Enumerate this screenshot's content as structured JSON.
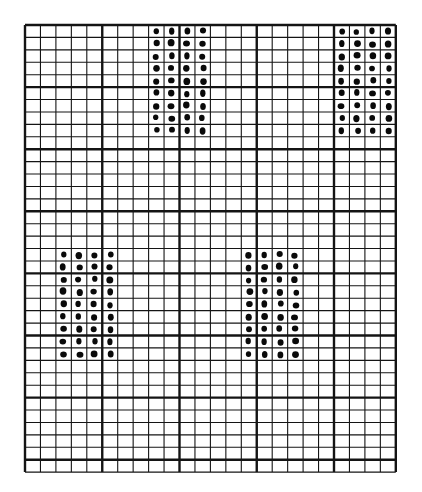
{
  "diagram": {
    "type": "graph-paper-dot-pattern",
    "background": "#ffffff",
    "line_color": "#141414",
    "dot_color": "#0a0a0a",
    "grid": {
      "left": 25,
      "top": 25,
      "columns": 24,
      "rows": 36,
      "cell_width": 15.45,
      "cell_height": 12.42,
      "major_every_col": 5,
      "major_every_row": 5
    },
    "dot_blocks": [
      {
        "name": "top-center-block",
        "col_start": 8,
        "cols": 4,
        "row_start": 0,
        "rows": 9
      },
      {
        "name": "top-right-block",
        "col_start": 20,
        "cols": 4,
        "row_start": 0,
        "rows": 9
      },
      {
        "name": "lower-left-block",
        "col_start": 2,
        "cols": 4,
        "row_start": 18,
        "rows": 9
      },
      {
        "name": "lower-right-block",
        "col_start": 14,
        "cols": 4,
        "row_start": 18,
        "rows": 9
      }
    ]
  }
}
